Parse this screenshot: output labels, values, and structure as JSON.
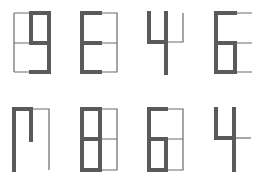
{
  "colors": {
    "background": "#ffffff",
    "guide_line": "#6b6b6b",
    "segment": "#5a5a5a"
  },
  "glyphs": [
    {
      "row": 1,
      "col": 1,
      "char": "9"
    },
    {
      "row": 1,
      "col": 2,
      "char": "E"
    },
    {
      "row": 1,
      "col": 3,
      "char": "4"
    },
    {
      "row": 1,
      "col": 4,
      "char": "6"
    },
    {
      "row": 2,
      "col": 1,
      "char": "Π"
    },
    {
      "row": 2,
      "col": 2,
      "char": "8"
    },
    {
      "row": 2,
      "col": 3,
      "char": "6"
    },
    {
      "row": 2,
      "col": 4,
      "char": "4"
    }
  ]
}
